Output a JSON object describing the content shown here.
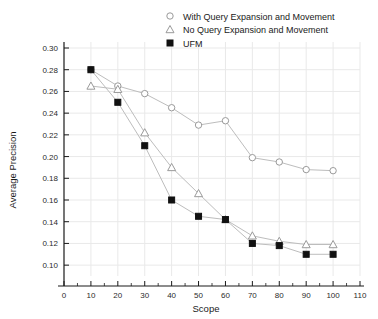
{
  "chart_data": {
    "type": "line",
    "title": "",
    "xlabel": "Scope",
    "ylabel": "Average Precision",
    "xlim": [
      0,
      110
    ],
    "ylim": [
      0.09,
      0.3
    ],
    "grid": true,
    "legend_position": "top-right",
    "x": [
      10,
      20,
      30,
      40,
      50,
      60,
      70,
      80,
      90,
      100
    ],
    "xticks": [
      "0",
      "10",
      "20",
      "30",
      "40",
      "50",
      "60",
      "70",
      "80",
      "90",
      "100",
      "110"
    ],
    "xtick_values": [
      0,
      10,
      20,
      30,
      40,
      50,
      60,
      70,
      80,
      90,
      100,
      110
    ],
    "yticks": [
      "0.10",
      "0.12",
      "0.14",
      "0.16",
      "0.18",
      "0.20",
      "0.22",
      "0.24",
      "0.26",
      "0.28",
      "0.30"
    ],
    "ytick_values": [
      0.1,
      0.12,
      0.14,
      0.16,
      0.18,
      0.2,
      0.22,
      0.24,
      0.26,
      0.28,
      0.3
    ],
    "series": [
      {
        "name": "With Query Expansion and Movement",
        "marker": "open-circle",
        "values": [
          0.28,
          0.265,
          0.258,
          0.245,
          0.229,
          0.233,
          0.199,
          0.195,
          0.188,
          0.187
        ]
      },
      {
        "name": "No Query Expansion and Movement",
        "marker": "open-triangle",
        "values": [
          0.265,
          0.262,
          0.222,
          0.19,
          0.166,
          0.142,
          0.127,
          0.122,
          0.119,
          0.119
        ]
      },
      {
        "name": "UFM",
        "marker": "filled-square",
        "values": [
          0.28,
          0.25,
          0.21,
          0.16,
          0.145,
          0.142,
          0.12,
          0.118,
          0.11,
          0.11
        ]
      }
    ]
  },
  "legend": {
    "entries": [
      {
        "label": "With Query Expansion and Movement",
        "marker": "open-circle"
      },
      {
        "label": "No Query Expansion and Movement",
        "marker": "open-triangle"
      },
      {
        "label": "UFM",
        "marker": "filled-square"
      }
    ]
  },
  "axes": {
    "x_title": "Scope",
    "y_title": "Average Precision"
  },
  "colors": {
    "line": "#bdbdbd",
    "marker_open_stroke": "#9a9a9a",
    "marker_filled": "#111111",
    "grid": "#e9e9e9",
    "axis": "#1a1a1a",
    "background": "#ffffff"
  }
}
